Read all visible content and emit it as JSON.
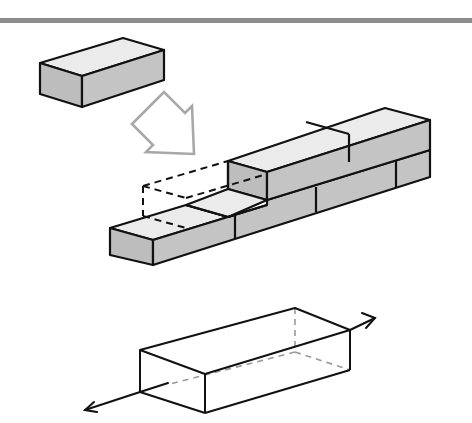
{
  "diagram": {
    "title": "",
    "header_rule_color": "#8c8c8c",
    "colors": {
      "outline": "#111111",
      "top_face": "#ebebeb",
      "side_face": "#bdbdbd",
      "arrow_outline": "#a8a8a8",
      "hidden_edge": "#9a9a9a",
      "background": "#ffffff"
    },
    "panels": [
      {
        "id": "single-brick",
        "description": "A single rectangular brick shown in isometric view"
      },
      {
        "id": "placement-arrow",
        "description": "Hollow gray arrow pointing down-right toward the wall"
      },
      {
        "id": "brick-wall",
        "description": "Two-course running-bond brick wall with a dashed outline marking the slot where the brick is placed"
      },
      {
        "id": "wireframe-brick",
        "description": "Wireframe brick with hidden edges dashed and a long axis arrow passing through it lengthwise"
      }
    ],
    "labels": []
  }
}
